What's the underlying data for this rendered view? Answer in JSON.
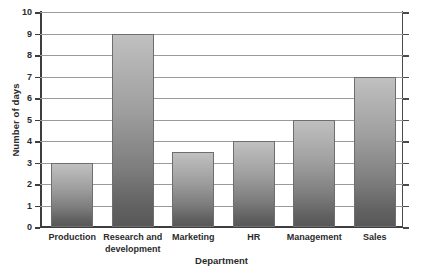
{
  "chart_data": {
    "type": "bar",
    "title": "",
    "xlabel": "Department",
    "ylabel": "Number of days",
    "categories": [
      "Production",
      "Research and development",
      "Marketing",
      "HR",
      "Management",
      "Sales"
    ],
    "category_lines": [
      [
        "Production"
      ],
      [
        "Research and",
        "development"
      ],
      [
        "Marketing"
      ],
      [
        "HR"
      ],
      [
        "Management"
      ],
      [
        "Sales"
      ]
    ],
    "values": [
      3,
      9,
      3.5,
      4,
      5,
      7
    ],
    "ylim": [
      0,
      10
    ],
    "y_ticks": [
      0,
      1,
      2,
      3,
      4,
      5,
      6,
      7,
      8,
      9,
      10
    ],
    "y_tick_labels": [
      "0",
      "1",
      "2",
      "3",
      "4",
      "5",
      "6",
      "7",
      "8",
      "9",
      "10"
    ],
    "grid": true,
    "legend": false,
    "legend_position": "none",
    "bar_fill_top": "#c0c0c0",
    "bar_fill_bottom": "#585858",
    "bar_border": "#6e6e6e",
    "gridline_color": "#9a9a9a",
    "axis_color": "#3d3d3d",
    "background": "#ffffff"
  }
}
